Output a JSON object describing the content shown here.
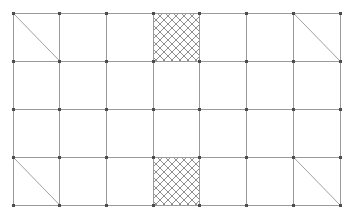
{
  "diagram": {
    "type": "structural-frame-elevation",
    "canvas": {
      "width": 352,
      "height": 219,
      "background": "#ffffff"
    },
    "style": {
      "grid_line_color": "#9a9a9a",
      "grid_line_width": 1,
      "brace_line_color": "#a0a0a0",
      "brace_line_width": 1,
      "hatch_line_color": "#8f8f8f",
      "hatch_line_width": 1,
      "node_color": "#4d4d4d",
      "node_size": 3
    },
    "grid": {
      "columns": 8,
      "rows": 4,
      "x_positions": [
        13,
        59.7,
        106.4,
        153.1,
        199.9,
        246.6,
        293.3,
        340
      ],
      "y_positions": [
        13,
        61,
        109,
        157,
        205
      ],
      "column_spacing": 46.7,
      "row_spacing": 48
    },
    "braces": [
      {
        "name": "brace-top-left",
        "column": 0,
        "row": 0,
        "direction": "tl-br"
      },
      {
        "name": "brace-top-right",
        "column": 6,
        "row": 0,
        "direction": "tl-br"
      },
      {
        "name": "brace-bottom-left",
        "column": 0,
        "row": 3,
        "direction": "tl-br"
      },
      {
        "name": "brace-bottom-right",
        "column": 6,
        "row": 3,
        "direction": "tl-br"
      }
    ],
    "shear_panels": [
      {
        "name": "shear-panel-top",
        "column": 3,
        "row": 0,
        "fill": "cross-hatch"
      },
      {
        "name": "shear-panel-bottom",
        "column": 3,
        "row": 3,
        "fill": "cross-hatch"
      }
    ],
    "hatch": {
      "pattern": "cross-hatch",
      "spacing": 8,
      "angles_deg": [
        45,
        -45
      ]
    },
    "nodes": {
      "shape": "square",
      "count": 45
    }
  }
}
